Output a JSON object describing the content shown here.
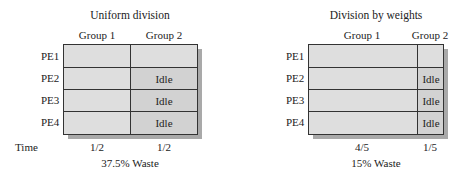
{
  "left": {
    "title": "Uniform division",
    "groups": [
      "Group 1",
      "Group 2"
    ],
    "rows": [
      "PE1",
      "PE2",
      "PE3",
      "PE4"
    ],
    "idle_label": "Idle",
    "idle_rows": [
      "PE2",
      "PE3",
      "PE4"
    ],
    "time_label": "Time",
    "times": [
      "1/2",
      "1/2"
    ],
    "waste": "37.5% Waste"
  },
  "right": {
    "title": "Division by weights",
    "groups": [
      "Group 1",
      "Group 2"
    ],
    "rows": [
      "PE1",
      "PE2",
      "PE3",
      "PE4"
    ],
    "idle_label": "Idle",
    "idle_rows": [
      "PE2",
      "PE3",
      "PE4"
    ],
    "times": [
      "4/5",
      "1/5"
    ],
    "waste": "15% Waste"
  },
  "colors": {
    "cell_fill": "#dedede",
    "idle_fill": "#d2d2d2",
    "shadow": "#a9a9a9",
    "line": "#333333"
  }
}
